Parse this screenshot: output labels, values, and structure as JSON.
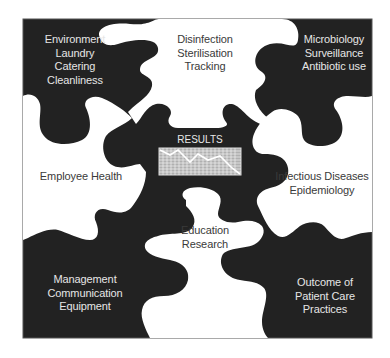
{
  "diagram": {
    "type": "jigsaw-puzzle",
    "colors": {
      "dark_piece": "#222222",
      "light_piece": "#ffffff",
      "frame": "#555555",
      "text_on_dark": "#e6e6e6",
      "text_on_light": "#3a3a3a"
    },
    "pieces": {
      "top_left": {
        "shade": "dark",
        "lines": [
          "Environment",
          "Laundry",
          "Catering",
          "Cleanliness"
        ]
      },
      "top_center": {
        "shade": "light",
        "lines": [
          "Disinfection",
          "Sterilisation",
          "Tracking"
        ]
      },
      "top_right": {
        "shade": "dark",
        "lines": [
          "Microbiology",
          "Surveillance",
          "Antibiotic use"
        ]
      },
      "middle_left": {
        "shade": "light",
        "lines": [
          "Employee Health"
        ]
      },
      "center": {
        "shade": "dark",
        "title": "RESULTS",
        "icon": "line-chart-grid-icon"
      },
      "middle_right": {
        "shade": "light",
        "lines": [
          "Infectious Diseases",
          "Epidemiology"
        ]
      },
      "bottom_left": {
        "shade": "dark",
        "lines": [
          "Management",
          "Communication",
          "Equipment"
        ]
      },
      "bottom_center": {
        "shade": "light",
        "lines": [
          "Education",
          "Research"
        ]
      },
      "bottom_right": {
        "shade": "dark",
        "lines": [
          "Outcome of",
          "Patient Care",
          "Practices"
        ]
      }
    }
  }
}
